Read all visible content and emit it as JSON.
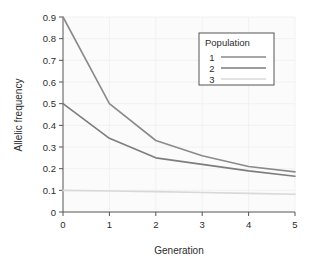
{
  "chart_data": {
    "type": "line",
    "title": "",
    "xlabel": "Generation",
    "ylabel": "Allelic frequency",
    "x": [
      0,
      1,
      2,
      3,
      4,
      5
    ],
    "xticklabels": [
      "0",
      "1",
      "2",
      "3",
      "4",
      "5"
    ],
    "yticklabels": [
      "0",
      "0.1",
      "0.2",
      "0.3",
      "0.4",
      "0.5",
      "0.6",
      "0.7",
      "0.8",
      "0.9"
    ],
    "yticks": [
      0,
      0.1,
      0.2,
      0.3,
      0.4,
      0.5,
      0.6,
      0.7,
      0.8,
      0.9
    ],
    "xlim": [
      0,
      5
    ],
    "ylim": [
      0,
      0.9
    ],
    "grid": true,
    "legend_title": "Population",
    "legend_position": "upper-right-inset",
    "series": [
      {
        "name": "1",
        "values": [
          0.9,
          0.5,
          0.33,
          0.26,
          0.21,
          0.185
        ],
        "color": "#8a8a8a"
      },
      {
        "name": "2",
        "values": [
          0.5,
          0.34,
          0.25,
          0.22,
          0.19,
          0.165
        ],
        "color": "#7d7d7d"
      },
      {
        "name": "3",
        "values": [
          0.1,
          0.097,
          0.094,
          0.09,
          0.086,
          0.082
        ],
        "color": "#d8d8d8"
      }
    ]
  },
  "colors": {
    "plot_background": "#fbfbfb",
    "grid": "#f1f1f1",
    "axis": "#555555",
    "text": "#2b2b2b",
    "legend_border": "#555555",
    "legend_background": "#ffffff"
  }
}
